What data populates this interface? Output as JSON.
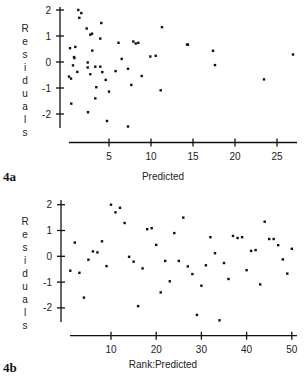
{
  "chart_data": [
    {
      "id": "4a",
      "type": "scatter",
      "figure_label": "4a",
      "title": "",
      "xlabel": "Predicted",
      "ylabel": "Residuals",
      "xlim": [
        0,
        27.5
      ],
      "ylim": [
        -2.6,
        2.2
      ],
      "xticks": [
        5,
        10,
        15,
        20,
        25
      ],
      "xtick_labels": [
        "5",
        "10",
        "15",
        "20",
        "25"
      ],
      "yticks": [
        2,
        1,
        0,
        -1,
        -2
      ],
      "ytick_labels": [
        "2",
        "1",
        "0",
        "-1",
        "-2"
      ],
      "grid": false,
      "legend": null,
      "points": [
        {
          "x": 0.24,
          "y": -0.56
        },
        {
          "x": 0.36,
          "y": 0.53
        },
        {
          "x": 0.48,
          "y": -0.64
        },
        {
          "x": 0.51,
          "y": -1.6
        },
        {
          "x": 0.71,
          "y": -0.13
        },
        {
          "x": 0.83,
          "y": 0.19
        },
        {
          "x": 0.88,
          "y": 0.15
        },
        {
          "x": 0.99,
          "y": 0.58
        },
        {
          "x": 1.23,
          "y": -0.38
        },
        {
          "x": 1.35,
          "y": 2.0
        },
        {
          "x": 1.46,
          "y": 1.7
        },
        {
          "x": 1.7,
          "y": 1.88
        },
        {
          "x": 2.35,
          "y": 1.29
        },
        {
          "x": 2.46,
          "y": -0.02
        },
        {
          "x": 2.46,
          "y": -0.21
        },
        {
          "x": 2.5,
          "y": -1.93
        },
        {
          "x": 2.77,
          "y": -0.47
        },
        {
          "x": 2.77,
          "y": 1.05
        },
        {
          "x": 2.98,
          "y": 1.09
        },
        {
          "x": 3.01,
          "y": 0.44
        },
        {
          "x": 3.37,
          "y": -1.4
        },
        {
          "x": 3.37,
          "y": -0.18
        },
        {
          "x": 3.49,
          "y": -0.97
        },
        {
          "x": 3.96,
          "y": 0.9
        },
        {
          "x": 3.96,
          "y": -0.18
        },
        {
          "x": 4.08,
          "y": 1.5
        },
        {
          "x": 4.2,
          "y": -0.39
        },
        {
          "x": 4.61,
          "y": -0.69
        },
        {
          "x": 4.76,
          "y": -2.27
        },
        {
          "x": 5.0,
          "y": -1.14
        },
        {
          "x": 5.78,
          "y": -0.35
        },
        {
          "x": 6.13,
          "y": 0.74
        },
        {
          "x": 6.51,
          "y": 0.12
        },
        {
          "x": 7.26,
          "y": -2.48
        },
        {
          "x": 7.26,
          "y": -0.26
        },
        {
          "x": 7.65,
          "y": -0.88
        },
        {
          "x": 7.89,
          "y": 0.79
        },
        {
          "x": 8.18,
          "y": 0.71
        },
        {
          "x": 8.49,
          "y": 0.74
        },
        {
          "x": 8.89,
          "y": -0.54
        },
        {
          "x": 9.92,
          "y": 0.21
        },
        {
          "x": 10.56,
          "y": 0.24
        },
        {
          "x": 11.15,
          "y": -1.09
        },
        {
          "x": 11.31,
          "y": 1.34
        },
        {
          "x": 14.3,
          "y": 0.67
        },
        {
          "x": 14.4,
          "y": 0.67
        },
        {
          "x": 17.38,
          "y": 0.43
        },
        {
          "x": 17.62,
          "y": -0.12
        },
        {
          "x": 23.45,
          "y": -0.67
        },
        {
          "x": 26.9,
          "y": 0.29
        }
      ]
    },
    {
      "id": "4b",
      "type": "scatter",
      "figure_label": "4b",
      "title": "",
      "xlabel": "Rank:Predicted",
      "ylabel": "Residuals",
      "xlim": [
        0,
        52
      ],
      "ylim": [
        -2.6,
        2.2
      ],
      "xticks": [
        10,
        20,
        30,
        40,
        50
      ],
      "xtick_labels": [
        "10",
        "20",
        "30",
        "40",
        "50"
      ],
      "yticks": [
        2,
        1,
        0,
        -1,
        -2
      ],
      "ytick_labels": [
        "2",
        "1",
        "0",
        "-1",
        "-2"
      ],
      "grid": false,
      "legend": null,
      "x": [
        1,
        2,
        3,
        4,
        5,
        6,
        7,
        8,
        9,
        10,
        11,
        12,
        13,
        14,
        15,
        16,
        17,
        18,
        19,
        20,
        21,
        22,
        23,
        24,
        25,
        26,
        27,
        28,
        29,
        30,
        31,
        32,
        33,
        34,
        35,
        36,
        37,
        38,
        39,
        40,
        41,
        42,
        43,
        44,
        45,
        46,
        47,
        48,
        49,
        50
      ],
      "y": [
        -0.56,
        0.53,
        -0.64,
        -1.6,
        -0.13,
        0.19,
        0.15,
        0.58,
        -0.38,
        2.0,
        1.7,
        1.88,
        1.29,
        -0.02,
        -0.21,
        -1.93,
        -0.47,
        1.05,
        1.09,
        0.44,
        -1.4,
        -0.18,
        -0.97,
        0.9,
        -0.18,
        1.5,
        -0.39,
        -0.69,
        -2.27,
        -1.14,
        -0.35,
        0.74,
        0.12,
        -2.48,
        -0.26,
        -0.88,
        0.79,
        0.71,
        0.74,
        -0.54,
        0.21,
        0.24,
        -1.09,
        1.34,
        0.67,
        0.67,
        0.43,
        -0.12,
        -0.67,
        0.29
      ]
    }
  ],
  "panels": {
    "a": {
      "figure_label": "4a",
      "xlabel": "Predicted",
      "ylabel_letters": [
        "R",
        "e",
        "s",
        "i",
        "d",
        "u",
        "a",
        "l",
        "s"
      ]
    },
    "b": {
      "figure_label": "4b",
      "xlabel": "Rank:Predicted",
      "ylabel_letters": [
        "R",
        "e",
        "s",
        "i",
        "d",
        "u",
        "a",
        "l",
        "s"
      ]
    }
  }
}
